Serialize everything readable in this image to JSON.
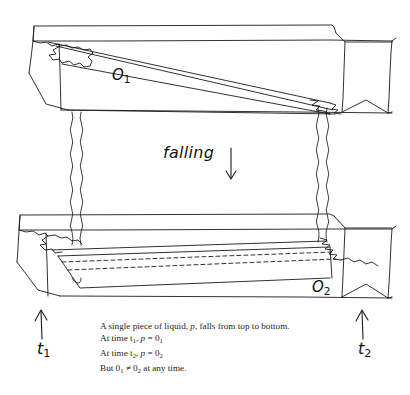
{
  "figure": {
    "background_color": "#ffffff",
    "ink_color": "#1b1b1b",
    "labels": {
      "top_object": "O",
      "top_object_sub": "1",
      "bottom_object": "O",
      "bottom_object_sub": "2",
      "falling": "falling",
      "time_top": "t",
      "time_top_sub": "1",
      "time_bottom": "t",
      "time_bottom_sub": "2"
    },
    "icons": {
      "down_arrow": "falling-arrow-down-icon",
      "up_arrow_left": "t1-arrow-up-icon",
      "up_arrow_right": "t2-arrow-up-icon"
    }
  },
  "caption": {
    "line1_a": "A single piece of liquid, ",
    "line1_p": "p",
    "line1_b": ", falls from top to bottom.",
    "line2_a": "At time t",
    "line2_sub1": "1",
    "line2_b": ", ",
    "line2_p": "p",
    "line2_c": " = 0",
    "line2_sub2": "1",
    "line3_a": "At time t",
    "line3_sub1": "2",
    "line3_b": ", ",
    "line3_p": "p",
    "line3_c": " = 0",
    "line3_sub2": "2",
    "line4_a": "But 0",
    "line4_sub1": "1",
    "line4_neq": " ≠ 0",
    "line4_sub2": "2",
    "line4_b": " at any time."
  }
}
